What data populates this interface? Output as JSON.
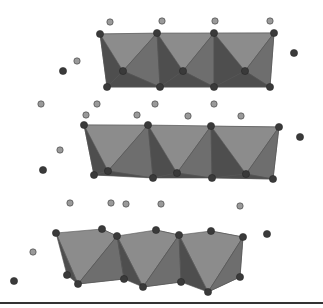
{
  "diagram": {
    "type": "crystal-structure-polyhedral-layers",
    "colors": {
      "face_light": "#8c8c8c",
      "face_mid": "#6e6e6e",
      "face_dark": "#4e4e4e",
      "atom_dark": "#3a3a3a",
      "atom_light": "#9a9a9a",
      "baseline": "#333333"
    },
    "layers": [
      {
        "name": "top-layer",
        "top_vertices": [
          [
            100,
            34
          ],
          [
            157,
            33
          ],
          [
            214,
            33
          ],
          [
            274,
            33
          ]
        ],
        "mid_vertices": [
          [
            123,
            71
          ],
          [
            183,
            71
          ],
          [
            245,
            71
          ]
        ],
        "bottom_vertices": [
          [
            107,
            87
          ],
          [
            160,
            87
          ],
          [
            214,
            87
          ],
          [
            270,
            87
          ]
        ]
      },
      {
        "name": "middle-layer",
        "top_vertices": [
          [
            84,
            125
          ],
          [
            148,
            125
          ],
          [
            211,
            126
          ],
          [
            279,
            127
          ]
        ],
        "mid_vertices": [
          [
            108,
            171
          ],
          [
            177,
            173
          ],
          [
            246,
            174
          ]
        ],
        "bottom_vertices": [
          [
            94,
            175
          ],
          [
            153,
            178
          ],
          [
            212,
            178
          ],
          [
            273,
            179
          ]
        ]
      },
      {
        "name": "bottom-layer",
        "top_vertices": [
          [
            56,
            233
          ],
          [
            117,
            236
          ],
          [
            179,
            235
          ],
          [
            243,
            237
          ]
        ],
        "back_top_vertices": [
          [
            102,
            229
          ],
          [
            156,
            230
          ],
          [
            211,
            231
          ]
        ],
        "bottom_vertices": [
          [
            78,
            284
          ],
          [
            143,
            287
          ],
          [
            208,
            292
          ]
        ],
        "back_bottom_vertices": [
          [
            67,
            275
          ],
          [
            124,
            279
          ],
          [
            181,
            282
          ],
          [
            240,
            277
          ]
        ]
      }
    ],
    "free_atoms_light": [
      [
        110,
        22
      ],
      [
        162,
        21
      ],
      [
        215,
        21
      ],
      [
        270,
        21
      ],
      [
        77,
        61
      ],
      [
        41,
        104
      ],
      [
        97,
        104
      ],
      [
        155,
        104
      ],
      [
        214,
        104
      ],
      [
        86,
        115
      ],
      [
        137,
        115
      ],
      [
        188,
        116
      ],
      [
        241,
        116
      ],
      [
        60,
        150
      ],
      [
        70,
        203
      ],
      [
        111,
        203
      ],
      [
        126,
        204
      ],
      [
        161,
        204
      ],
      [
        240,
        206
      ],
      [
        33,
        252
      ]
    ],
    "free_atoms_dark": [
      [
        63,
        71
      ],
      [
        294,
        53
      ],
      [
        43,
        170
      ],
      [
        300,
        137
      ],
      [
        267,
        234
      ],
      [
        14,
        281
      ]
    ],
    "baseline_y": 303
  }
}
